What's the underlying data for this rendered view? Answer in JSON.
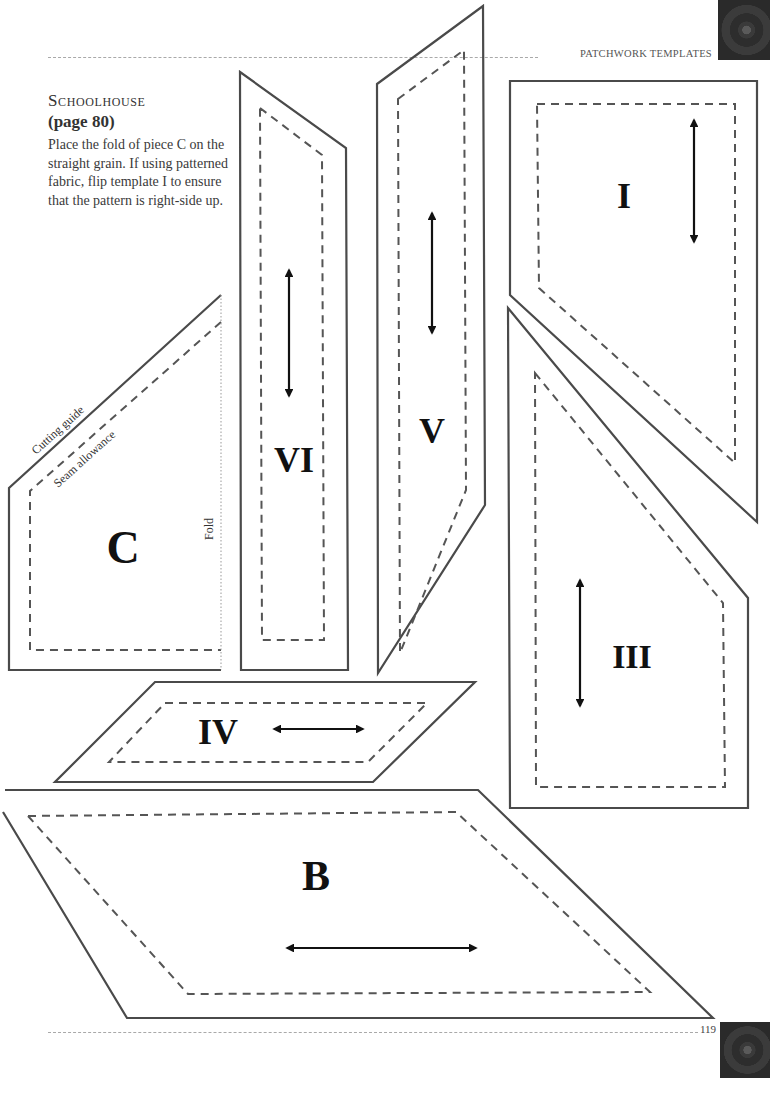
{
  "header": {
    "section_title": "PATCHWORK TEMPLATES"
  },
  "intro": {
    "title": "Schoolhouse",
    "page_ref": "(page 80)",
    "body": "Place the fold of piece C on the straight grain. If using patterned fabric, flip template I to ensure that the pattern is right-side up."
  },
  "templates": {
    "c": {
      "label": "C",
      "cutting_guide": "Cutting guide",
      "seam_allowance": "Seam allowance",
      "fold": "Fold"
    },
    "vi": {
      "label": "VI",
      "grain": "vertical"
    },
    "v": {
      "label": "V",
      "grain": "vertical"
    },
    "i": {
      "label": "I",
      "grain": "vertical"
    },
    "iii": {
      "label": "III",
      "grain": "vertical"
    },
    "iv": {
      "label": "IV",
      "grain": "horizontal"
    },
    "b": {
      "label": "B",
      "grain": "horizontal"
    }
  },
  "footer": {
    "page_number": "119"
  },
  "colors": {
    "outline": "#4a4a4a",
    "seam": "#555555",
    "grain_arrow": "#111111",
    "rule": "#a9a9a9"
  }
}
